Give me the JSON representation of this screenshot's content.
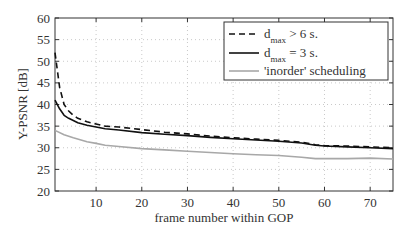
{
  "chart_data": {
    "type": "line",
    "title": "",
    "xlabel": "frame number within GOP",
    "ylabel": "Y-PSNR [dB]",
    "xlim": [
      1,
      75
    ],
    "ylim": [
      20,
      60
    ],
    "xticks": [
      10,
      20,
      30,
      40,
      50,
      60,
      70
    ],
    "yticks": [
      20,
      25,
      30,
      35,
      40,
      45,
      50,
      55,
      60
    ],
    "grid": true,
    "legend_position": "upper right",
    "series": [
      {
        "name": "d_max > 6 s.",
        "legend_main": "d",
        "legend_sub": "max",
        "legend_tail": " > 6 s.",
        "style": "dashed",
        "color": "#111111",
        "x": [
          1,
          2,
          3,
          4,
          5,
          6,
          8,
          10,
          12,
          15,
          20,
          25,
          30,
          35,
          40,
          45,
          50,
          55,
          58,
          60,
          65,
          70,
          75
        ],
        "y": [
          52,
          44,
          40,
          38.5,
          37.5,
          36.8,
          36,
          35.5,
          35,
          34.8,
          34.2,
          33.6,
          33.2,
          32.7,
          32.3,
          32,
          31.7,
          31.3,
          30.7,
          30.5,
          30.4,
          30.2,
          30.0
        ]
      },
      {
        "name": "d_max = 3 s.",
        "legend_main": "d",
        "legend_sub": "max",
        "legend_tail": " =  3 s.",
        "style": "solid",
        "color": "#111111",
        "x": [
          1,
          2,
          3,
          4,
          5,
          6,
          8,
          10,
          12,
          15,
          20,
          25,
          30,
          35,
          40,
          45,
          50,
          55,
          58,
          60,
          65,
          70,
          75
        ],
        "y": [
          41,
          39,
          37.5,
          36.8,
          36.3,
          35.8,
          35.2,
          34.8,
          34.4,
          34.1,
          33.5,
          33.1,
          32.8,
          32.4,
          32.1,
          31.8,
          31.5,
          31.1,
          30.6,
          30.4,
          30.2,
          30.0,
          29.8
        ]
      },
      {
        "name": "'inorder' scheduling",
        "legend_main": "'inorder' scheduling",
        "legend_sub": "",
        "legend_tail": "",
        "style": "solid",
        "color": "#a8a8a8",
        "x": [
          1,
          3,
          5,
          8,
          10,
          12,
          15,
          20,
          25,
          30,
          35,
          40,
          45,
          50,
          55,
          58,
          60,
          65,
          70,
          75
        ],
        "y": [
          34,
          33,
          32.3,
          31.4,
          31,
          30.6,
          30.3,
          29.8,
          29.5,
          29.2,
          28.9,
          28.6,
          28.4,
          28.2,
          27.8,
          27.5,
          27.5,
          27.5,
          27.6,
          27.4
        ]
      }
    ]
  }
}
